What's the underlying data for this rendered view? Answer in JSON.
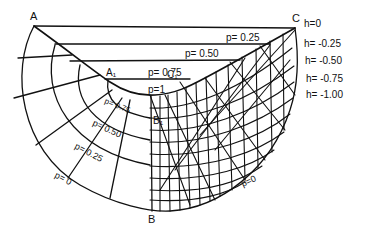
{
  "figure": {
    "type": "flow-net",
    "stroke_color": "#111111",
    "background": "#ffffff",
    "points": {
      "A": "A",
      "A1": "A₁",
      "B": "B",
      "B1": "B₁",
      "C": "C",
      "C1": "C₁"
    },
    "top_p_labels": [
      {
        "key": "p025",
        "text": "p= 0.25"
      },
      {
        "key": "p050",
        "text": "p= 0.50"
      },
      {
        "key": "p075",
        "text": "p= 0.75"
      },
      {
        "key": "p1",
        "text": "p=1"
      }
    ],
    "left_p_labels": [
      {
        "key": "p075",
        "text": "p= 0.75"
      },
      {
        "key": "p050",
        "text": "p= 0.50"
      },
      {
        "key": "p025",
        "text": "p= 0.25"
      },
      {
        "key": "p0",
        "text": "p= 0"
      }
    ],
    "right_p_label": "p=0",
    "h_labels": [
      "h=0",
      "h= -0.25",
      "h= -0.50",
      "h= -0.75",
      "h= -1.00"
    ]
  }
}
